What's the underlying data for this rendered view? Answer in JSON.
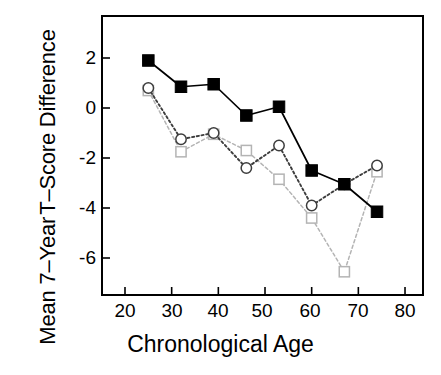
{
  "chart_data": {
    "type": "line",
    "title": "",
    "xlabel": "Chronological Age",
    "ylabel": "Mean 7–Year T–Score Difference",
    "ylabel_lines": [
      "Mean 7–Year",
      "T–Score Difference"
    ],
    "xlim": [
      20,
      80
    ],
    "ylim": [
      -7.4,
      3.3
    ],
    "xticks": [
      20,
      30,
      40,
      50,
      60,
      70,
      80
    ],
    "xticklabels": [
      "20",
      "30",
      "40",
      "50",
      "60",
      "70",
      "80"
    ],
    "yticks": [
      2,
      0,
      -2,
      -4,
      -6
    ],
    "yticklabels": [
      "2",
      "0",
      "-2",
      "-4",
      "-6"
    ],
    "grid": false,
    "legend": "none",
    "x": [
      25,
      32,
      39,
      46,
      53,
      60,
      67,
      74
    ],
    "series": [
      {
        "name": "filled-square-solid",
        "marker": "filled-square",
        "linestyle": "solid",
        "color": "#000000",
        "values": [
          1.9,
          0.85,
          0.95,
          -0.3,
          0.05,
          -2.5,
          -3.05,
          -4.15
        ]
      },
      {
        "name": "open-circle-dotted",
        "marker": "open-circle",
        "linestyle": "dotted",
        "color": "#3d3d3d",
        "values": [
          0.8,
          -1.25,
          -1.0,
          -2.4,
          -1.5,
          -3.9,
          -3.05,
          -2.3
        ]
      },
      {
        "name": "open-square-dashed",
        "marker": "open-square",
        "linestyle": "dashed-gray",
        "color": "#b4b4b4",
        "values": [
          0.7,
          -1.75,
          -1.05,
          -1.7,
          -2.85,
          -4.4,
          -6.55,
          -2.55
        ]
      }
    ]
  },
  "caption": {
    "text": ""
  }
}
